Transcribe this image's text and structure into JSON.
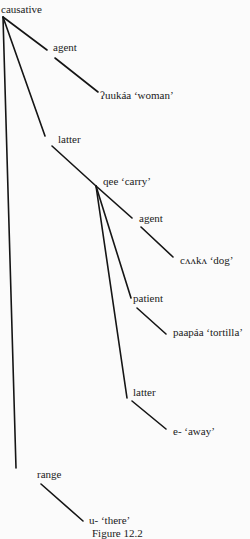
{
  "diagram": {
    "type": "tree",
    "nodes": {
      "root": "causative",
      "agent1": "agent",
      "woman": "ʔuukáa ‘woman’",
      "latter1": "latter",
      "carry": "qee ‘carry’",
      "agent2": "agent",
      "dog": "cʌʌkʌ ‘dog’",
      "patient": "patient",
      "tortilla": "paapáa ‘tortilla’",
      "latter2": "latter",
      "away": "e- ‘away’",
      "range": "range",
      "there": "u- ‘there’"
    },
    "edges": [
      [
        "root",
        "agent1"
      ],
      [
        "agent1",
        "woman"
      ],
      [
        "root",
        "latter1"
      ],
      [
        "latter1",
        "carry"
      ],
      [
        "carry",
        "agent2"
      ],
      [
        "agent2",
        "dog"
      ],
      [
        "carry",
        "patient"
      ],
      [
        "patient",
        "tortilla"
      ],
      [
        "carry",
        "latter2"
      ],
      [
        "latter2",
        "away"
      ],
      [
        "root",
        "range"
      ],
      [
        "range",
        "there"
      ]
    ],
    "caption": "Figure 12.2"
  }
}
